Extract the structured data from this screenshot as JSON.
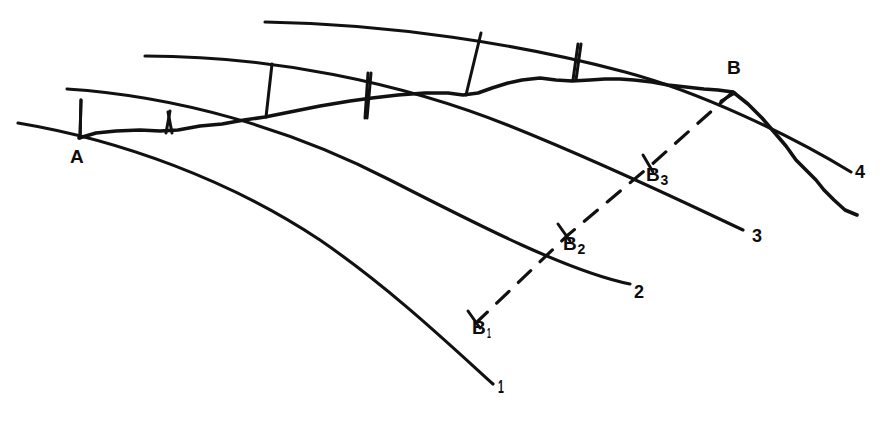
{
  "figure": {
    "width": 882,
    "height": 421,
    "background_color": "#ffffff",
    "ink_color": "#111111"
  },
  "points": [
    {
      "id": "A",
      "label": "A",
      "sub": "",
      "x": 80,
      "y": 138,
      "label_x": 70,
      "label_y": 147
    },
    {
      "id": "B",
      "label": "B",
      "sub": "",
      "x": 733,
      "y": 92,
      "label_x": 727,
      "label_y": 64
    },
    {
      "id": "B1",
      "label": "B",
      "sub": "1",
      "x": 477,
      "y": 322,
      "label_x": 472,
      "label_y": 325
    },
    {
      "id": "B2",
      "label": "B",
      "sub": "2",
      "x": 568,
      "y": 235,
      "label_x": 563,
      "label_y": 241
    },
    {
      "id": "B3",
      "label": "B",
      "sub": "3",
      "x": 650,
      "y": 166,
      "label_x": 646,
      "label_y": 172
    }
  ],
  "curve_labels": [
    {
      "id": "curve-1",
      "label": "1",
      "x": 498,
      "y": 382,
      "thin": true
    },
    {
      "id": "curve-2",
      "label": "2",
      "x": 634,
      "y": 288,
      "thin": false
    },
    {
      "id": "curve-3",
      "label": "3",
      "x": 752,
      "y": 231,
      "thin": false
    },
    {
      "id": "curve-4",
      "label": "4",
      "x": 855,
      "y": 167,
      "thin": false
    }
  ],
  "arcs": [
    {
      "id": "arc-1",
      "name": "arc-curve-1",
      "path": "M 18,123 C 120,140 230,180 320,240 C 390,288 450,345 493,384"
    },
    {
      "id": "arc-2",
      "name": "arc-curve-2",
      "path": "M 67,89 C 175,96 290,128 390,180 C 480,226 570,272 630,284"
    },
    {
      "id": "arc-3",
      "name": "arc-curve-3",
      "path": "M 145,56 C 270,56 400,82 510,126 C 610,166 700,210 743,230"
    },
    {
      "id": "arc-4",
      "name": "arc-curve-4",
      "path": "M 265,22 C 390,24 520,44 625,72 C 700,92 790,135 851,172"
    }
  ],
  "profile": {
    "id": "profile-line",
    "name": "irregular-profile-line",
    "description": "Jagged profile from A through B continuing to lower right",
    "path": "M 79,138 L 96,133 L 116,131 L 140,130 L 160,131 L 178,130 L 200,126 L 222,124 L 244,120 L 265,117 L 290,112 L 320,106 L 350,101 L 372,98 L 398,95 L 425,93 L 448,93 L 463,95 L 478,93 L 492,88 L 508,83 L 522,80 L 540,78 L 556,80 L 572,81 L 590,80 L 605,79 L 620,79 L 634,80 L 652,82 L 668,85 L 686,87 L 704,89 L 718,90 L 733,92 L 748,104 L 762,118 L 774,132 L 786,146 L 796,160 L 806,170 L 816,180 L 824,190 L 834,200 L 845,210 L 857,215"
  },
  "tie_lines": [
    {
      "id": "tie-1",
      "name": "tie-line-1",
      "x1": 81,
      "y1": 100,
      "x2": 80,
      "y2": 138
    },
    {
      "id": "tie-2",
      "name": "tie-line-2",
      "x1": 168,
      "y1": 112,
      "x2": 172,
      "y2": 133
    },
    {
      "id": "tie-3",
      "name": "tie-line-3",
      "x1": 170,
      "y1": 112,
      "x2": 166,
      "y2": 133
    },
    {
      "id": "tie-4",
      "name": "tie-line-4",
      "x1": 272,
      "y1": 64,
      "x2": 266,
      "y2": 117
    },
    {
      "id": "tie-5",
      "name": "tie-line-5",
      "x1": 368,
      "y1": 73,
      "x2": 365,
      "y2": 118
    },
    {
      "id": "tie-6",
      "name": "tie-line-6",
      "x1": 371,
      "y1": 73,
      "x2": 367,
      "y2": 118
    },
    {
      "id": "tie-7",
      "name": "tie-line-7",
      "x1": 481,
      "y1": 33,
      "x2": 466,
      "y2": 95
    },
    {
      "id": "tie-8",
      "name": "tie-line-8",
      "x1": 578,
      "y1": 44,
      "x2": 573,
      "y2": 80
    },
    {
      "id": "tie-9",
      "name": "tie-line-9",
      "x1": 581,
      "y1": 44,
      "x2": 576,
      "y2": 80
    }
  ],
  "dashed": {
    "id": "dashed-radial",
    "name": "dashed-radial-line",
    "path": "M 733,92 L 650,166 L 568,235 L 477,322"
  },
  "caption": ""
}
